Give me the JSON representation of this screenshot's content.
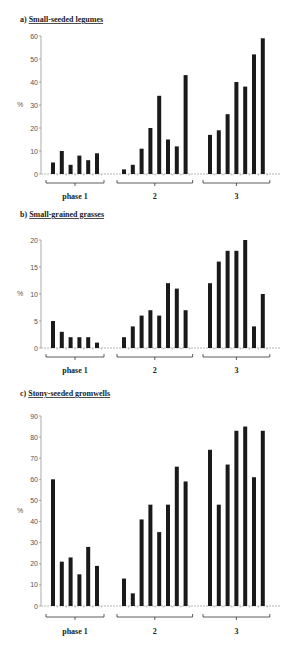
{
  "chart_data": [
    {
      "type": "bar",
      "title": "a) Small-seeded legumes",
      "title_prefix": "a)",
      "title_text": "Small-seeded legumes",
      "ylabel": "%",
      "xlabel": "",
      "ylim": [
        0,
        60
      ],
      "yticks": [
        0,
        10,
        20,
        30,
        40,
        50,
        60
      ],
      "groups": [
        {
          "label": "phase 1",
          "values": [
            5,
            10,
            4,
            8,
            6,
            9
          ]
        },
        {
          "label": "2",
          "values": [
            2,
            4,
            11,
            20,
            34,
            15,
            12,
            43
          ]
        },
        {
          "label": "3",
          "values": [
            17,
            19,
            26,
            40,
            38,
            52,
            59
          ]
        }
      ]
    },
    {
      "type": "bar",
      "title": "b) Small-grained grasses",
      "title_prefix": "b)",
      "title_text": "Small-grained grasses",
      "ylabel": "%",
      "xlabel": "",
      "ylim": [
        0,
        20
      ],
      "yticks": [
        0,
        5,
        10,
        15,
        20
      ],
      "groups": [
        {
          "label": "phase 1",
          "values": [
            5,
            3,
            2,
            2,
            2,
            1
          ]
        },
        {
          "label": "2",
          "values": [
            2,
            4,
            6,
            7,
            6,
            12,
            11,
            7
          ]
        },
        {
          "label": "3",
          "values": [
            12,
            16,
            18,
            18,
            20,
            4,
            10
          ]
        }
      ]
    },
    {
      "type": "bar",
      "title": "c) Stony-seeded gromwells",
      "title_prefix": "c)",
      "title_text": "Stony-seeded gromwells",
      "ylabel": "%",
      "xlabel": "",
      "ylim": [
        0,
        90
      ],
      "yticks": [
        0,
        10,
        20,
        30,
        40,
        50,
        60,
        70,
        80,
        90
      ],
      "groups": [
        {
          "label": "phase 1",
          "values": [
            60,
            21,
            23,
            15,
            28,
            19
          ]
        },
        {
          "label": "2",
          "values": [
            13,
            6,
            41,
            48,
            35,
            48,
            66,
            59
          ]
        },
        {
          "label": "3",
          "values": [
            74,
            48,
            67,
            83,
            85,
            61,
            83
          ]
        }
      ]
    }
  ]
}
